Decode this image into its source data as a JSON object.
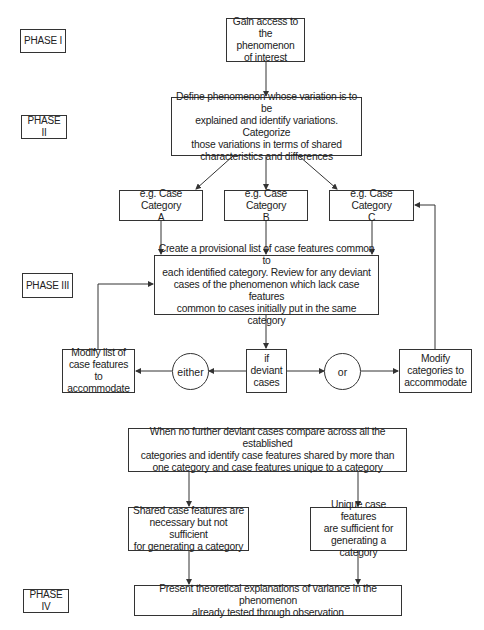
{
  "phases": [
    {
      "label": "PHASE I"
    },
    {
      "label": "PHASE II"
    },
    {
      "label": "PHASE III"
    },
    {
      "label": "PHASE IV"
    }
  ],
  "nodes": {
    "access": "Gain access to\nthe phenomenon\nof interest",
    "define": "Define phenomenon whose variation is to be\nexplained and identify variations. Categorize\nthose variations in terms of shared\ncharacteristics and differences",
    "category_a": "e.g. Case Category\nA",
    "category_b": "e.g. Case Category\nB",
    "category_c": "e.g. Case Category\nC",
    "provisional": "Create a provisional list of case features common to\neach identified category. Review for any deviant\ncases of the phenomenon which lack case features\ncommon to cases initially put in the same category",
    "modify_list": "Modify list of\ncase features to\naccommodate",
    "either": "either",
    "deviant": "if\ndeviant\ncases",
    "or": "or",
    "modify_categories": "Modify\ncategories to\naccommodate",
    "compare": "When no further deviant cases compare across all the established\ncategories and identify case features shared by more than\none category and case features unique to a category",
    "shared": "Shared case features are\nnecessary but not sufficient\nfor generating a category",
    "unique": "Unique case features\nare sufficient for\ngenerating a category",
    "present": "Present theoretical explanations of variance in the phenomenon\nalready tested through observation"
  },
  "colors": {
    "line": "#333333",
    "background": "#ffffff"
  }
}
